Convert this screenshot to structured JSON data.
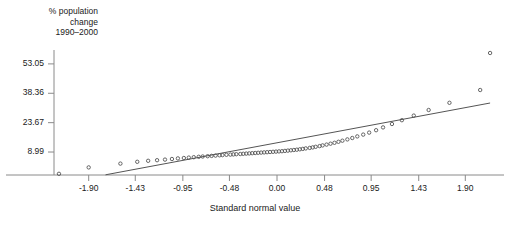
{
  "chart_data": {
    "type": "scatter",
    "title": "",
    "ylabel": "% population\nchange\n1990–2000",
    "xlabel": "Standard normal value",
    "grid": false,
    "legend": null,
    "xlim": [
      -2.25,
      2.25
    ],
    "ylim": [
      -2.5,
      60.0
    ],
    "xticks": [
      -1.9,
      -1.43,
      -0.95,
      -0.48,
      0.0,
      0.48,
      0.95,
      1.43,
      1.9
    ],
    "xtick_labels": [
      "-1.90",
      "-1.43",
      "-0.95",
      "-0.48",
      "0.00",
      "0.48",
      "0.95",
      "1.43",
      "1.90"
    ],
    "yticks": [
      8.99,
      23.67,
      38.36,
      53.05
    ],
    "ytick_labels": [
      "8.99",
      "23.67",
      "38.36",
      "53.05"
    ],
    "point_marker": "open-circle",
    "point_color": "#555555",
    "line_color": "#555555",
    "reference_line": {
      "name": "normal reference line",
      "x": [
        -1.73,
        2.15
      ],
      "y": [
        -2.4,
        33.5
      ]
    },
    "series": [
      {
        "name": "% population change 1990-2000",
        "x": [
          -2.2,
          -1.9,
          -1.58,
          -1.41,
          -1.3,
          -1.21,
          -1.13,
          -1.06,
          -1.0,
          -0.94,
          -0.89,
          -0.84,
          -0.79,
          -0.75,
          -0.7,
          -0.66,
          -0.62,
          -0.58,
          -0.55,
          -0.51,
          -0.47,
          -0.44,
          -0.41,
          -0.37,
          -0.34,
          -0.31,
          -0.28,
          -0.25,
          -0.22,
          -0.19,
          -0.16,
          -0.13,
          -0.1,
          -0.07,
          -0.04,
          -0.01,
          0.02,
          0.05,
          0.08,
          0.11,
          0.14,
          0.17,
          0.2,
          0.23,
          0.26,
          0.29,
          0.33,
          0.36,
          0.39,
          0.43,
          0.46,
          0.5,
          0.54,
          0.58,
          0.62,
          0.66,
          0.71,
          0.76,
          0.81,
          0.87,
          0.93,
          1.0,
          1.07,
          1.16,
          1.26,
          1.38,
          1.53,
          1.74,
          2.05,
          2.15
        ],
        "y": [
          -1.9,
          1.3,
          3.2,
          4.1,
          4.6,
          4.9,
          5.2,
          5.5,
          5.8,
          6.0,
          6.2,
          6.4,
          6.6,
          6.75,
          6.9,
          7.05,
          7.2,
          7.35,
          7.45,
          7.6,
          7.7,
          7.8,
          7.9,
          8.0,
          8.1,
          8.2,
          8.3,
          8.4,
          8.5,
          8.6,
          8.7,
          8.8,
          8.9,
          9.0,
          9.1,
          9.2,
          9.3,
          9.4,
          9.55,
          9.7,
          9.85,
          10.0,
          10.15,
          10.35,
          10.55,
          10.8,
          11.05,
          11.3,
          11.6,
          11.95,
          12.3,
          12.7,
          13.15,
          13.6,
          14.1,
          14.65,
          15.3,
          16.0,
          16.8,
          17.7,
          18.7,
          19.9,
          21.3,
          23.0,
          24.9,
          27.2,
          30.0,
          33.6,
          40.0,
          58.5
        ]
      }
    ]
  }
}
